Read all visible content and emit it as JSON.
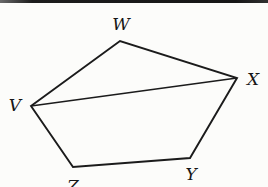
{
  "figure": {
    "type": "geometry-diagram",
    "vertices": [
      {
        "label": "V",
        "x": 31,
        "y": 106
      },
      {
        "label": "W",
        "x": 120,
        "y": 41
      },
      {
        "label": "X",
        "x": 237,
        "y": 78
      },
      {
        "label": "Y",
        "x": 190,
        "y": 158
      },
      {
        "label": "Z",
        "x": 73,
        "y": 167
      }
    ],
    "outline_points": "31,106 120,41 237,78 190,158 73,167",
    "diagonal_points": "31,106 237,78",
    "edges": [
      "VW",
      "WX",
      "XY",
      "YZ",
      "ZV",
      "VX"
    ]
  },
  "colors": {
    "line": "#1b1b1b",
    "background": "#fcfcfa",
    "top_rule": "#1c1c1c"
  }
}
